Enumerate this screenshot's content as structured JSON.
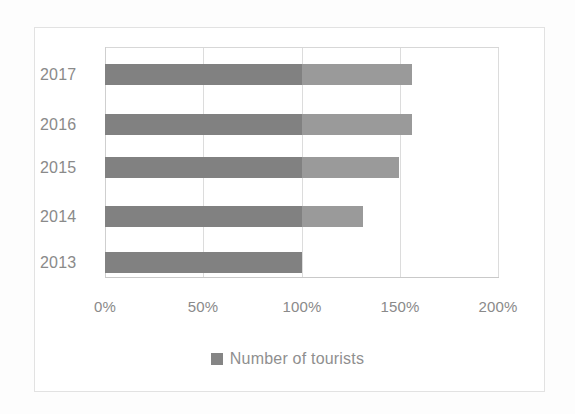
{
  "chart_data": {
    "type": "bar",
    "orientation": "horizontal",
    "title": "",
    "xlabel": "",
    "ylabel": "",
    "categories": [
      "2013",
      "2014",
      "2015",
      "2016",
      "2017"
    ],
    "display_order_top_to_bottom": [
      "2017",
      "2016",
      "2015",
      "2014",
      "2013"
    ],
    "values": [
      100,
      131,
      149,
      156,
      156
    ],
    "value_unit": "%",
    "series": [
      {
        "name": "Number of tourists",
        "values": [
          100,
          131,
          149,
          156,
          156
        ],
        "color": "#818181"
      }
    ],
    "xlim": [
      0,
      200
    ],
    "xticks": [
      0,
      50,
      100,
      150,
      200
    ],
    "xtick_labels": [
      "0%",
      "50%",
      "100%",
      "150%",
      "200%"
    ],
    "grid": true,
    "grid_axis": "x",
    "legend": {
      "position": "bottom",
      "entries": [
        {
          "label": "Number of tourists",
          "color": "#858585",
          "marker": "square"
        }
      ]
    },
    "bar_color": "#818181",
    "bar_tail_color": "#9a9a9a",
    "gridline_color": "#dcdcdc",
    "background_color": "#ffffff",
    "border_color": "#e2e2e2",
    "text_color": "#8a8a8a"
  },
  "axis": {
    "y_categories": [
      {
        "label": "2017",
        "top": 64
      },
      {
        "label": "2016",
        "top": 114
      },
      {
        "label": "2015",
        "top": 157
      },
      {
        "label": "2014",
        "top": 206
      },
      {
        "label": "2013",
        "top": 252
      }
    ],
    "x_ticks": [
      {
        "label": "0%",
        "left": 105
      },
      {
        "label": "50%",
        "left": 203
      },
      {
        "label": "100%",
        "left": 302
      },
      {
        "label": "150%",
        "left": 400
      },
      {
        "label": "200%",
        "left": 498
      }
    ]
  },
  "bars": [
    {
      "category": "2017",
      "value": 156,
      "top": 64,
      "left": 105,
      "width": 307,
      "tail_width": 110
    },
    {
      "category": "2016",
      "value": 156,
      "top": 114,
      "left": 105,
      "width": 307,
      "tail_width": 110
    },
    {
      "category": "2015",
      "value": 149,
      "top": 157,
      "left": 105,
      "width": 294,
      "tail_width": 97
    },
    {
      "category": "2014",
      "value": 131,
      "top": 206,
      "left": 105,
      "width": 258,
      "tail_width": 61
    },
    {
      "category": "2013",
      "value": 100,
      "top": 252,
      "left": 105,
      "width": 197,
      "tail_width": 0
    }
  ],
  "legend": {
    "label": "Number of tourists"
  }
}
